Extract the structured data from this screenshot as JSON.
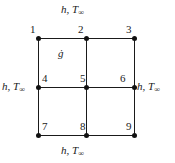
{
  "figure": {
    "background_color": "#ffffff",
    "line_color": "#1a1a1a",
    "node_color": "#111111"
  },
  "boundary_conditions": {
    "top": {
      "h": "h",
      "comma": ", ",
      "T": "T",
      "sub": "∞"
    },
    "bottom": {
      "h": "h",
      "comma": ", ",
      "T": "T",
      "sub": "∞"
    },
    "left": {
      "h": "h",
      "comma": ", ",
      "T": "T",
      "sub": "∞"
    },
    "right": {
      "h": "h",
      "comma": ", ",
      "T": "T",
      "sub": "∞"
    }
  },
  "heat_generation": {
    "symbol": "ġ"
  },
  "nodes": [
    {
      "id": 1,
      "label": "1",
      "x": 38,
      "y": 38,
      "label_x": 30,
      "label_y": 24
    },
    {
      "id": 2,
      "label": "2",
      "x": 86,
      "y": 38,
      "label_x": 78,
      "label_y": 24
    },
    {
      "id": 3,
      "label": "3",
      "x": 134,
      "y": 38,
      "label_x": 126,
      "label_y": 24
    },
    {
      "id": 4,
      "label": "4",
      "x": 38,
      "y": 87,
      "label_x": 42,
      "label_y": 73
    },
    {
      "id": 5,
      "label": "5",
      "x": 86,
      "y": 87,
      "label_x": 80,
      "label_y": 73
    },
    {
      "id": 6,
      "label": "6",
      "x": 134,
      "y": 87,
      "label_x": 120,
      "label_y": 73
    },
    {
      "id": 7,
      "label": "7",
      "x": 38,
      "y": 135,
      "label_x": 42,
      "label_y": 121
    },
    {
      "id": 8,
      "label": "8",
      "x": 86,
      "y": 135,
      "label_x": 80,
      "label_y": 121
    },
    {
      "id": 9,
      "label": "9",
      "x": 134,
      "y": 135,
      "label_x": 126,
      "label_y": 121
    }
  ],
  "grid": {
    "rows": 3,
    "columns": 3,
    "horizontal_lines": [
      38,
      87,
      135
    ],
    "vertical_lines": [
      38,
      86,
      134
    ]
  }
}
